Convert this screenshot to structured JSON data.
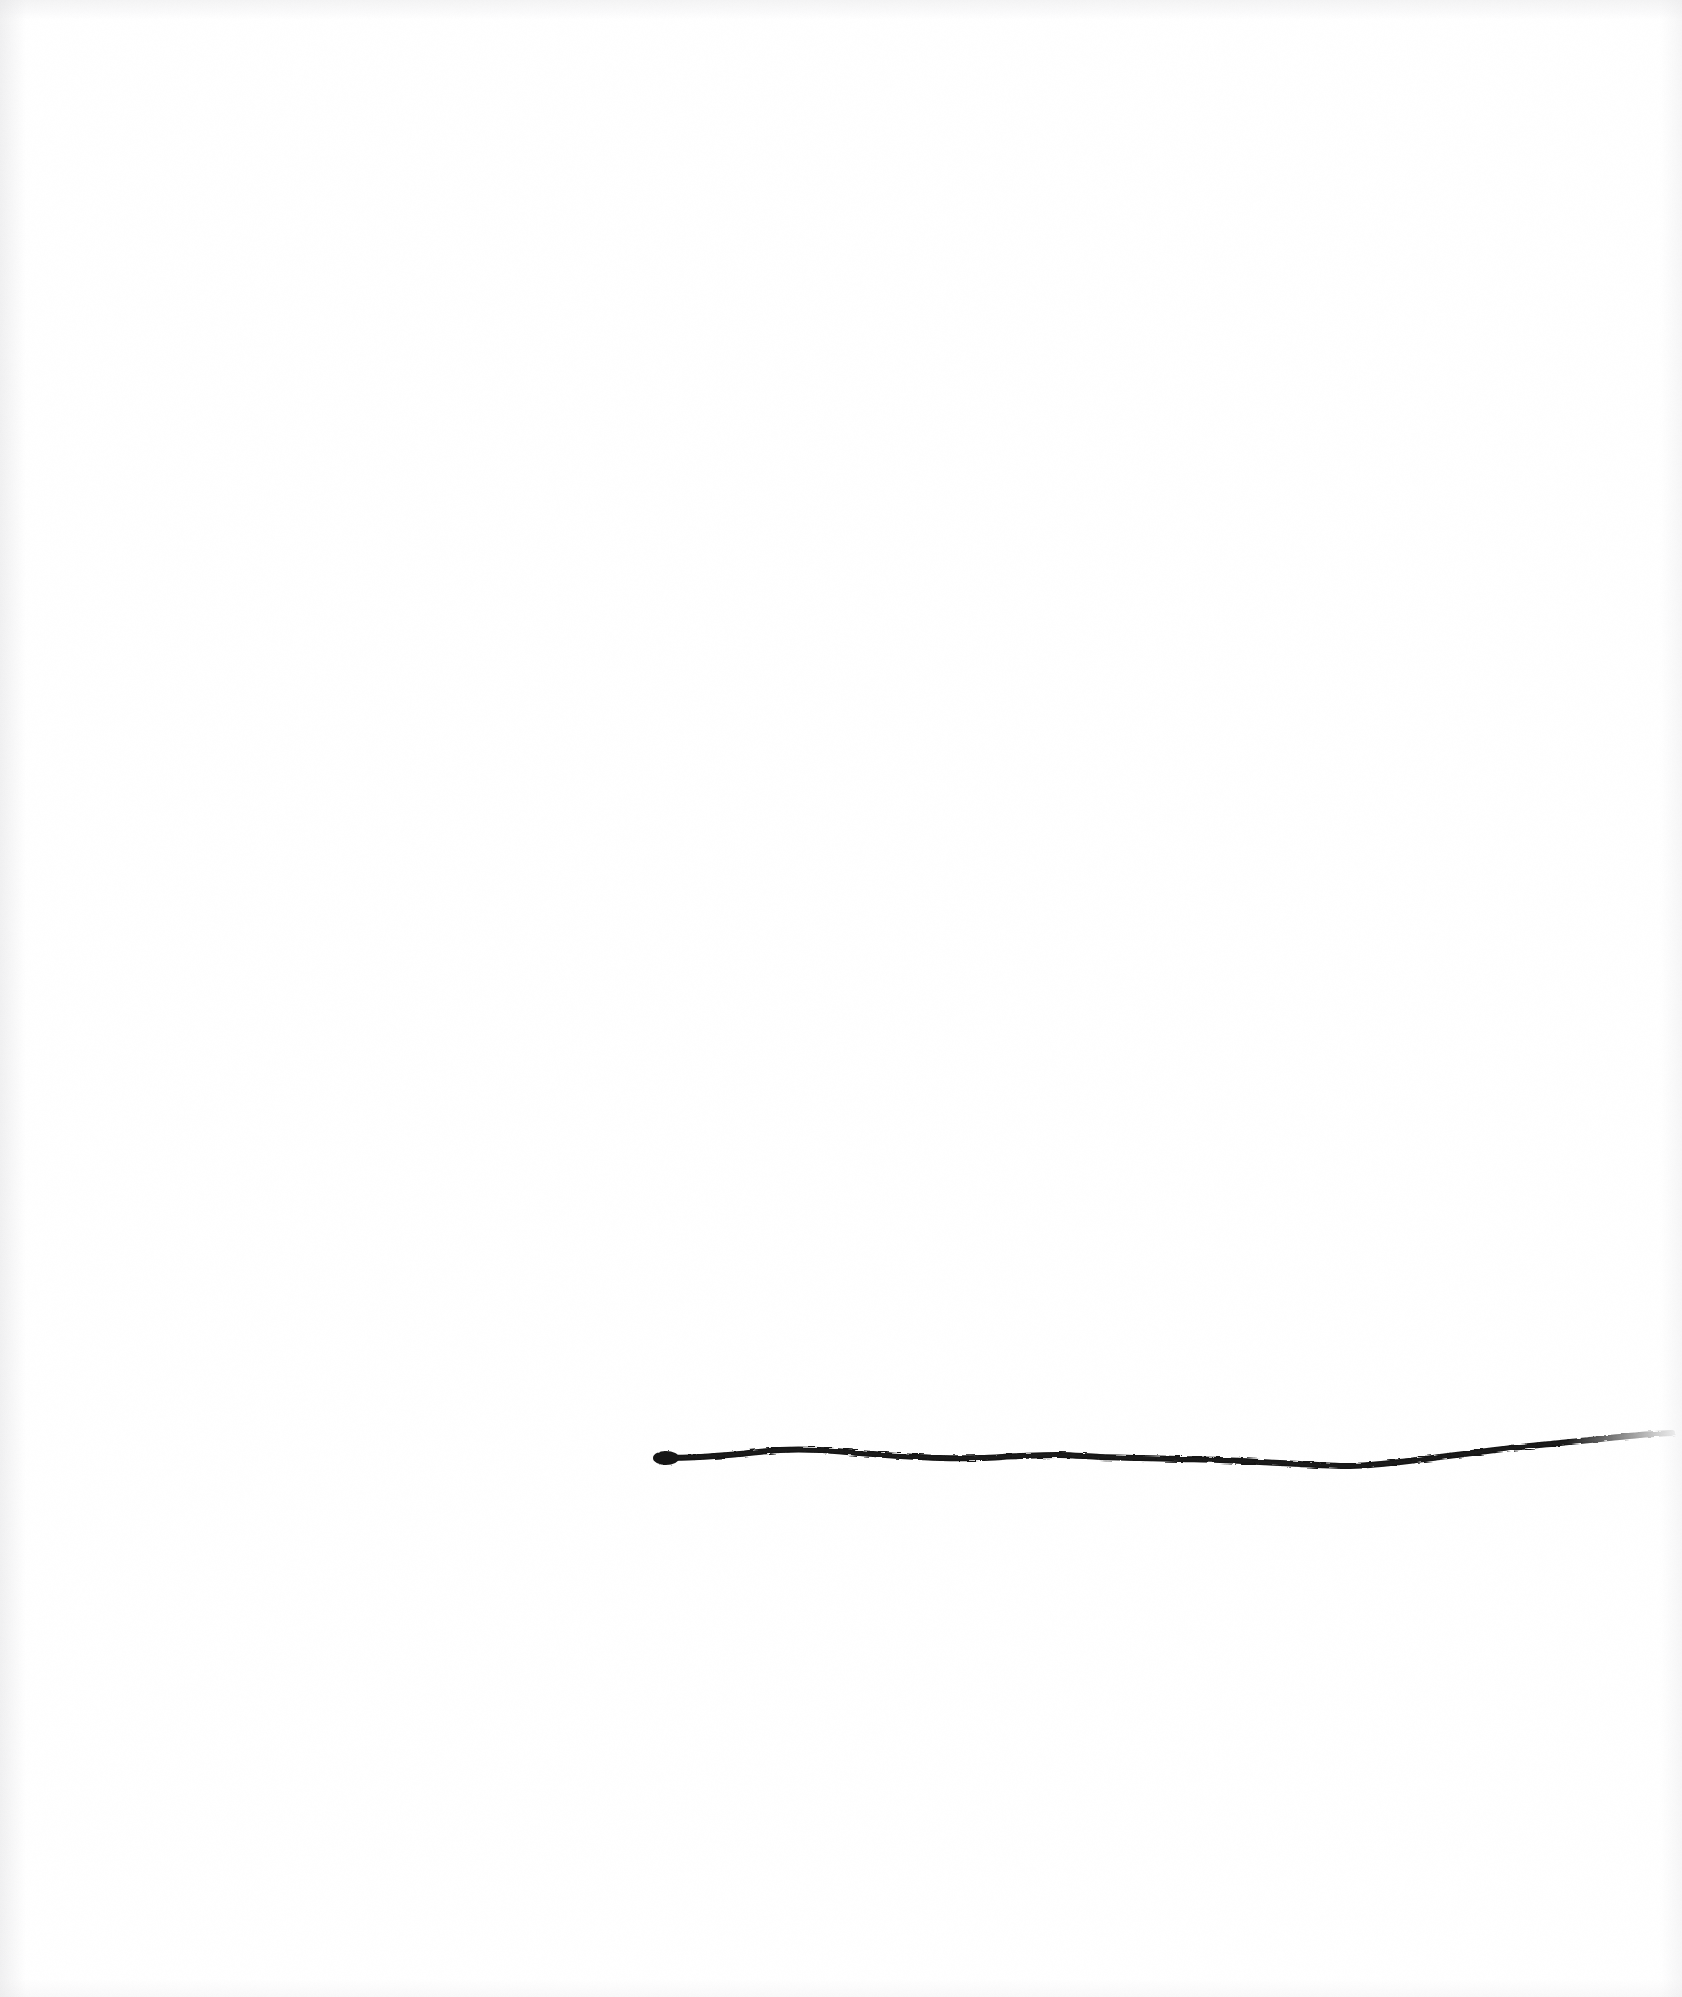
{
  "artwork": {
    "title": "Untitled (single horizontal line)",
    "medium_note": "charcoal / ink line on white paper",
    "canvas": {
      "width": 1682,
      "height": 1997
    },
    "background_color": "#ffffff",
    "ink_color": "#141414",
    "vignette_color": "#e6e6e8",
    "caption": "",
    "visible_text": ""
  },
  "chart_data": {
    "type": "line",
    "title": "",
    "xlabel": "",
    "ylabel": "",
    "grid": false,
    "legend": "none",
    "axis_visible": false,
    "xlim": [
      0,
      1682
    ],
    "ylim": [
      1997,
      0
    ],
    "stroke_color": "#141414",
    "series": [
      {
        "name": "hand-drawn-line",
        "stroke_width_px": 6,
        "start_blob": {
          "x": 666,
          "y": 1458,
          "radius_x": 13,
          "radius_y": 7
        },
        "taper_end": {
          "x": 1672,
          "y": 1433
        },
        "x": [
          666,
          700,
          740,
          780,
          820,
          860,
          900,
          940,
          980,
          1020,
          1060,
          1100,
          1140,
          1180,
          1220,
          1260,
          1300,
          1340,
          1370,
          1400,
          1440,
          1480,
          1520,
          1560,
          1600,
          1640,
          1672
        ],
        "y": [
          1458,
          1457,
          1454,
          1450,
          1450,
          1453,
          1456,
          1458,
          1458,
          1456,
          1455,
          1457,
          1458,
          1459,
          1460,
          1462,
          1464,
          1466,
          1465,
          1462,
          1457,
          1452,
          1447,
          1443,
          1439,
          1435,
          1433
        ]
      }
    ]
  },
  "overlay": {
    "alt_text": "A single slightly wavering horizontal dark line drawn across the lower right half of an otherwise blank white page."
  }
}
